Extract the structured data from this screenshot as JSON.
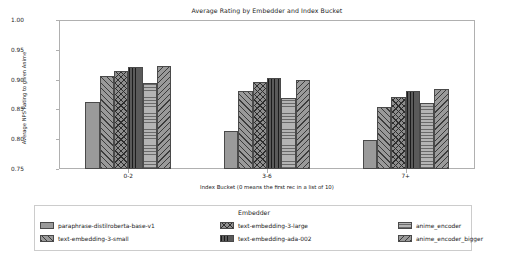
{
  "chart_data": {
    "type": "bar",
    "title": "Average Rating by Embedder and Index Bucket",
    "xlabel": "Index Bucket (0 means the first rec in a list of 10)",
    "ylabel": "Average NPS Rating to given Anime",
    "categories": [
      "0-2",
      "3-6",
      "7+"
    ],
    "ylim": [
      0.75,
      1.0
    ],
    "yticks": [
      "1.00",
      "0.95",
      "0.90",
      "0.85",
      "0.80",
      "0.75"
    ],
    "ytick_values": [
      1.0,
      0.95,
      0.9,
      0.85,
      0.8,
      0.75
    ],
    "grid": false,
    "legend_position": "below-axes",
    "legend_title": "Embedder",
    "series": [
      {
        "name": "paraphrase-distilroberta-base-v1",
        "hatch": "solid",
        "color": "#9a9a9a",
        "values": [
          0.862,
          0.814,
          0.799
        ]
      },
      {
        "name": "text-embedding-3-small",
        "hatch": "forward-diagonal",
        "color": "#9a9a9a",
        "values": [
          0.906,
          0.881,
          0.854
        ]
      },
      {
        "name": "text-embedding-3-large",
        "hatch": "cross",
        "color": "#8e8e8e",
        "values": [
          0.915,
          0.896,
          0.871
        ]
      },
      {
        "name": "text-embedding-ada-002",
        "hatch": "vertical",
        "color": "#5a5a5a",
        "values": [
          0.921,
          0.903,
          0.881
        ]
      },
      {
        "name": "anime_encoder",
        "hatch": "horizontal",
        "color": "#b4b4b4",
        "values": [
          0.895,
          0.869,
          0.861
        ]
      },
      {
        "name": "anime_encoder_bigger",
        "hatch": "back-diagonal",
        "color": "#9a9a9a",
        "values": [
          0.923,
          0.899,
          0.885
        ]
      }
    ]
  }
}
